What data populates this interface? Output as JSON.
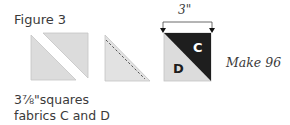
{
  "figure": {
    "title": "Figure 3",
    "caption_line1": "3⅞\"squares",
    "caption_line2": "fabrics C and D",
    "dimension_label": "3\"",
    "fabric_top": "C",
    "fabric_bottom": "D",
    "make_label": "Make 96"
  },
  "colors": {
    "light_fabric": "#dcdcdc",
    "dark_fabric": "#1e1e1e",
    "outline": "#bdbdbd",
    "text": "#3a3a3a"
  }
}
